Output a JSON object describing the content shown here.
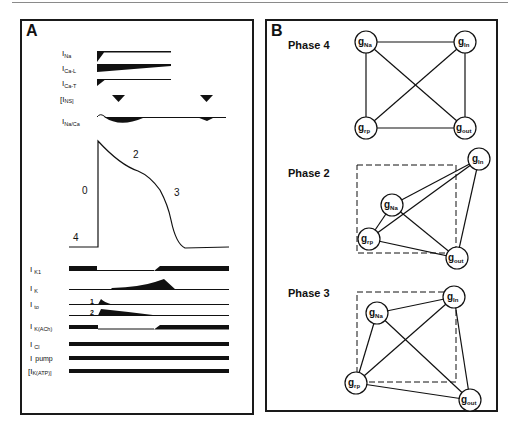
{
  "figure": {
    "panel_a": {
      "letter": "A",
      "top_currents": [
        {
          "label": "I",
          "sub": "Na",
          "key": "INa"
        },
        {
          "label": "I",
          "sub": "Ca-L",
          "key": "ICa-L"
        },
        {
          "label": "I",
          "sub": "Ca-T",
          "key": "ICa-T"
        },
        {
          "label": "[I",
          "sub": "NS]",
          "key": "INS"
        },
        {
          "label": "I",
          "sub": "Na/Ca",
          "key": "INa/Ca"
        }
      ],
      "action_potential": {
        "phase_labels": [
          "0",
          "2",
          "3",
          "4"
        ]
      },
      "bottom_currents": [
        {
          "label": "I",
          "sub": "K1",
          "key": "IK1"
        },
        {
          "label": "I",
          "sub": "K",
          "key": "IK"
        },
        {
          "label": "I",
          "sub": "to",
          "key": "Ito",
          "components": [
            "1",
            "2"
          ]
        },
        {
          "label": "I",
          "sub": "K(ACh)",
          "key": "IK(ACh)"
        },
        {
          "label": "I",
          "sub": "Cl",
          "key": "ICl"
        },
        {
          "label": "I",
          "sub": "pump",
          "key": "Ipump"
        },
        {
          "label": "[I",
          "sub": "K(ATP)]",
          "key": "IK(ATP)"
        }
      ]
    },
    "panel_b": {
      "letter": "B",
      "node_labels": {
        "na": {
          "main": "g",
          "sub": "Na"
        },
        "in": {
          "main": "g",
          "sub": "In"
        },
        "rp": {
          "main": "g",
          "sub": "rp"
        },
        "out": {
          "main": "g",
          "sub": "out"
        }
      },
      "phases": [
        {
          "title": "Phase 4"
        },
        {
          "title": "Phase 2"
        },
        {
          "title": "Phase 3"
        }
      ]
    }
  }
}
